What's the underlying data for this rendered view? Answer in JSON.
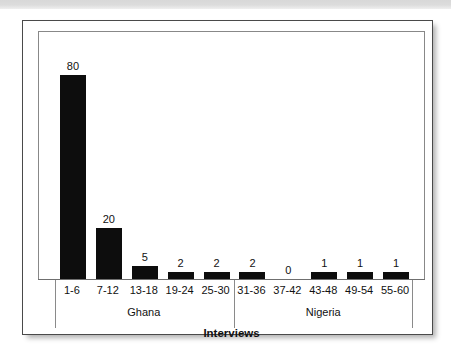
{
  "chart_data": {
    "type": "bar",
    "title": "",
    "xlabel": "Interviews",
    "ylabel": "Number of New Codes",
    "categories": [
      "1-6",
      "7-12",
      "13-18",
      "19-24",
      "25-30",
      "31-36",
      "37-42",
      "43-48",
      "49-54",
      "55-60"
    ],
    "values": [
      80,
      20,
      5,
      2,
      2,
      2,
      0,
      1,
      1,
      1
    ],
    "data_labels": [
      "80",
      "20",
      "5",
      "2",
      "2",
      "2",
      "0",
      "1",
      "1",
      "1"
    ],
    "groups": [
      {
        "label": "Ghana",
        "categories": [
          "1-6",
          "7-12",
          "13-18",
          "19-24",
          "25-30"
        ]
      },
      {
        "label": "Nigeria",
        "categories": [
          "31-36",
          "37-42",
          "43-48",
          "49-54",
          "55-60"
        ]
      }
    ],
    "ylim": [
      0,
      80
    ],
    "grid": false,
    "legend": "none",
    "bar_color": "#0d0d0d",
    "axis_color": "#6f6f6f",
    "background_color": "#ffffff"
  }
}
